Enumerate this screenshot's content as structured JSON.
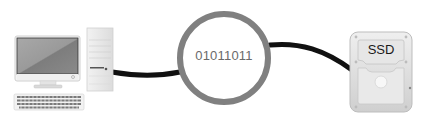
{
  "diagram": {
    "nodes": [
      {
        "id": "computer",
        "label": "Desktop computer (monitor, tower, keyboard)"
      },
      {
        "id": "data",
        "label": "01011011"
      },
      {
        "id": "ssd",
        "label": "SSD"
      }
    ],
    "edges": [
      {
        "from": "computer",
        "to": "data"
      },
      {
        "from": "data",
        "to": "ssd"
      }
    ],
    "colors": {
      "cable": "#111111",
      "ring": "#808080",
      "bits_text": "#6a6a6a",
      "ssd_body": "#d9d9d9",
      "monitor_screen": "#8c8c8c"
    }
  },
  "data_bubble": {
    "text": "01011011"
  },
  "ssd": {
    "label": "SSD"
  }
}
